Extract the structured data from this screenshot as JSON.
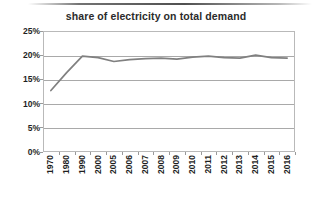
{
  "chart_data": {
    "type": "line",
    "title": "share of electricity on total demand",
    "xlabel": "",
    "ylabel": "",
    "ylim": [
      0,
      25
    ],
    "ytick_labels": [
      "0%",
      "5%",
      "10%",
      "15%",
      "20%",
      "25%"
    ],
    "ytick_values": [
      0,
      5,
      10,
      15,
      20,
      25
    ],
    "grid": true,
    "legend": "none",
    "categories": [
      "1970",
      "1980",
      "1990",
      "2000",
      "2005",
      "2006",
      "2007",
      "2008",
      "2009",
      "2010",
      "2011",
      "2012",
      "2013",
      "2014",
      "2015",
      "2016"
    ],
    "values": [
      12.7,
      16.4,
      19.8,
      19.5,
      18.7,
      19.1,
      19.3,
      19.4,
      19.2,
      19.6,
      19.8,
      19.5,
      19.4,
      20.0,
      19.5,
      19.4
    ],
    "series": [
      {
        "name": "share of electricity on total demand",
        "values": [
          12.7,
          16.4,
          19.8,
          19.5,
          18.7,
          19.1,
          19.3,
          19.4,
          19.2,
          19.6,
          19.8,
          19.5,
          19.4,
          20.0,
          19.5,
          19.4
        ]
      }
    ],
    "line_color": "#808080",
    "gridline_color": "#a9a9a9",
    "plot_border_color": "#b9b9b9",
    "background_color": "#ffffff"
  }
}
